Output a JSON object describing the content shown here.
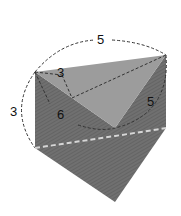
{
  "figure": {
    "type": "triangular-prism",
    "colors": {
      "top_face": "#9a9a9a",
      "left_face": "#6e6e6e",
      "right_face": "#6a6a6a",
      "hatch": "#5c5c5c",
      "dashed_dark": "#333333",
      "dashed_light": "#d0d0d0"
    },
    "labels": {
      "top_arc": "5",
      "top_short": "3",
      "left_arc": "3",
      "inner": "6",
      "right": "5"
    }
  }
}
